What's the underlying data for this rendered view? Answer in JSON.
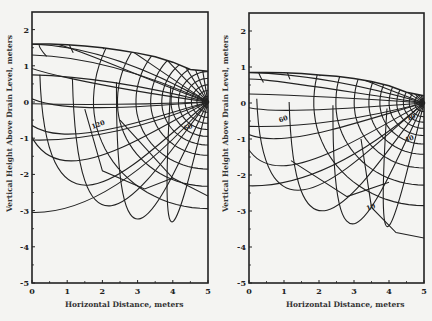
{
  "chart_data": [
    {
      "type": "contour",
      "title": "",
      "subtitle": "Flow net toward tile drain (left panel)",
      "xlabel": "Horizontal Distance, meters",
      "ylabel": "Vertical Height Above Drain Level, meters",
      "xlim": [
        0,
        5
      ],
      "ylim": [
        -5,
        2.4
      ],
      "xticks": [
        0,
        1,
        2,
        3,
        4,
        5
      ],
      "yticks": [
        -5,
        -4,
        -3,
        -2,
        -1,
        0,
        1,
        2
      ],
      "grid": false,
      "drain_location": [
        5,
        0
      ],
      "water_table": {
        "x": [
          0,
          0.5,
          1,
          1.5,
          2,
          2.5,
          3,
          3.5,
          4,
          4.5,
          5
        ],
        "y": [
          1.6,
          1.6,
          1.58,
          1.55,
          1.5,
          1.43,
          1.35,
          1.25,
          1.1,
          0.9,
          0.85
        ]
      },
      "contour_labels": [
        {
          "text": "120",
          "x": 1.9,
          "y": -0.68
        },
        {
          "text": "60",
          "x": 4.45,
          "y": -0.75
        }
      ],
      "equipotential_radii_m": [
        0.15,
        0.3,
        0.45,
        0.62,
        0.8,
        1.0,
        1.25,
        1.55,
        1.95,
        2.45,
        3.1
      ],
      "left_edge_intercepts_y": [
        1.6,
        1.3,
        0.75,
        -0.05,
        -1.05,
        -3.05
      ],
      "deep_curves": [
        {
          "desc": "curve through bottom",
          "x": [
            1.5,
            2.0,
            3.2,
            4.0
          ],
          "y": [
            -0.2,
            -1.9,
            -2.4,
            -2.1
          ]
        },
        {
          "desc": "curve to right edge",
          "x": [
            2.5,
            4.0,
            5.0
          ],
          "y": [
            -0.5,
            -2.1,
            -2.6
          ]
        }
      ]
    },
    {
      "type": "contour",
      "title": "",
      "subtitle": "Flow net toward tile drain (right panel)",
      "xlabel": "Horizontal Distance, meters",
      "ylabel": "Vertical Height Above Drain Level, meters",
      "xlim": [
        0,
        5
      ],
      "ylim": [
        -5,
        2.4
      ],
      "xticks": [
        0,
        1,
        2,
        3,
        4,
        5
      ],
      "yticks": [
        -5,
        -4,
        -3,
        -2,
        -1,
        0,
        1,
        2
      ],
      "grid": false,
      "drain_location": [
        5,
        0
      ],
      "water_table": {
        "x": [
          0,
          0.5,
          1,
          1.5,
          2,
          2.5,
          3,
          3.5,
          4,
          4.5,
          5
        ],
        "y": [
          0.85,
          0.85,
          0.84,
          0.82,
          0.78,
          0.74,
          0.68,
          0.6,
          0.48,
          0.3,
          0.2
        ]
      },
      "contour_labels": [
        {
          "text": "60",
          "x": 1.0,
          "y": -0.5
        },
        {
          "text": "10",
          "x": 4.65,
          "y": -0.45
        },
        {
          "text": "40",
          "x": 4.6,
          "y": -1.05
        },
        {
          "text": "10",
          "x": 3.5,
          "y": -2.95
        }
      ],
      "equipotential_radii_m": [
        0.12,
        0.25,
        0.4,
        0.56,
        0.74,
        0.95,
        1.2,
        1.5,
        1.9,
        2.4,
        3.0
      ],
      "left_edge_intercepts_y": [
        0.85,
        0.25,
        -0.65,
        -2.3
      ],
      "deep_curves": [
        {
          "desc": "curve through bottom",
          "x": [
            1.2,
            2.8,
            4.0
          ],
          "y": [
            -1.6,
            -2.6,
            -2.2
          ]
        },
        {
          "desc": "curve to right edge",
          "x": [
            3.2,
            3.5,
            4.2,
            5.0
          ],
          "y": [
            -1.0,
            -2.9,
            -3.6,
            -3.75
          ]
        }
      ]
    }
  ],
  "left": {
    "xlabel": "Horizontal Distance, meters",
    "ylabel": "Vertical Height Above Drain Level, meters"
  },
  "right": {
    "xlabel": "Horizontal Distance, meters",
    "ylabel": "Vertical Height Above Drain Level, meters"
  },
  "colors": {
    "ink": "#222222",
    "paper": "#f4f4f2"
  }
}
